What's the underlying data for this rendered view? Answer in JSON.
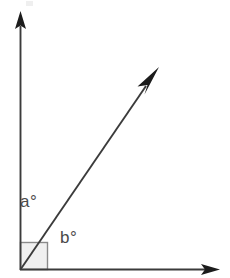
{
  "figure": {
    "type": "geometry-diagram",
    "background_color": "#ffffff",
    "width": 230,
    "height": 278,
    "stroke_color": "#3b3b3b",
    "label_color": "#4a4a4a",
    "right_angle_fill": "#f0f0f0",
    "right_angle_stroke": "#8a8a8a",
    "vertex": {
      "x": 20,
      "y": 270
    },
    "rays": [
      {
        "name": "vertical-axis",
        "from": {
          "x": 20,
          "y": 270
        },
        "to": {
          "x": 20,
          "y": 14
        },
        "arrowhead": true,
        "direction": "up"
      },
      {
        "name": "horizontal-axis",
        "from": {
          "x": 20,
          "y": 270
        },
        "to": {
          "x": 218,
          "y": 270
        },
        "arrowhead": true,
        "direction": "right"
      },
      {
        "name": "diagonal-ray",
        "from": {
          "x": 20,
          "y": 270
        },
        "to": {
          "x": 158,
          "y": 70
        },
        "arrowhead": true,
        "direction": "up-right",
        "angle_from_horizontal_deg": 55
      }
    ],
    "right_angle_marker": {
      "name": "right-angle-square",
      "x": 20,
      "y": 242,
      "size": 28,
      "measure": "90"
    },
    "labels": {
      "a": "a°",
      "b": "b°"
    },
    "label_positions": {
      "a": {
        "x": 20,
        "y": 193
      },
      "b": {
        "x": 60,
        "y": 229
      }
    },
    "artifact": {
      "name": "top-edge-artifact",
      "x": 26,
      "y": 1,
      "width": 7,
      "height": 5
    }
  }
}
